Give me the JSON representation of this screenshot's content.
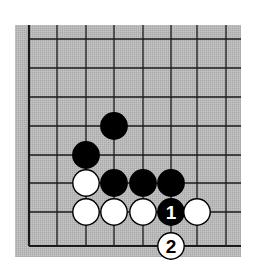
{
  "diagram": {
    "type": "go-board-corner",
    "colors": {
      "board": "#b4b4b4",
      "line": "#1a1a1a",
      "black_stone": "#000000",
      "white_stone": "#ffffff",
      "page": "#ffffff"
    },
    "grid": {
      "columns": 8,
      "rows": 8,
      "origin_x": 29,
      "origin_y": 39,
      "spacing_x": 28.2,
      "spacing_y": 29,
      "board_left": 15,
      "board_top": 25,
      "board_right": 241,
      "board_bottom": 257,
      "edge_left_x": 29,
      "edge_bottom_y": 246,
      "right_extent_x": 241,
      "top_extent_y": 25
    },
    "stones": [
      {
        "color": "black",
        "col": 3,
        "row": 2,
        "label": ""
      },
      {
        "color": "black",
        "col": 2,
        "row": 3,
        "label": ""
      },
      {
        "color": "white",
        "col": 2,
        "row": 4,
        "label": ""
      },
      {
        "color": "black",
        "col": 3,
        "row": 4,
        "label": ""
      },
      {
        "color": "black",
        "col": 4,
        "row": 4,
        "label": ""
      },
      {
        "color": "black",
        "col": 5,
        "row": 4,
        "label": ""
      },
      {
        "color": "white",
        "col": 2,
        "row": 5,
        "label": ""
      },
      {
        "color": "white",
        "col": 3,
        "row": 5,
        "label": ""
      },
      {
        "color": "white",
        "col": 4,
        "row": 5,
        "label": ""
      },
      {
        "color": "black",
        "col": 5,
        "row": 5,
        "label": "1"
      },
      {
        "color": "white",
        "col": 6,
        "row": 5,
        "label": ""
      },
      {
        "color": "white",
        "col": 5,
        "row": 6,
        "label": "2"
      }
    ],
    "move_labels": [
      "1",
      "2"
    ]
  }
}
